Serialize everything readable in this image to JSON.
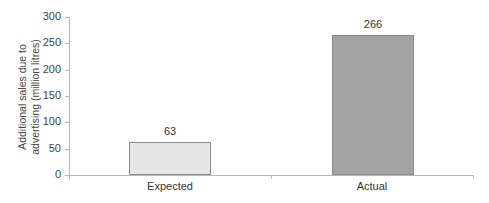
{
  "chart_data": {
    "type": "bar",
    "title": "",
    "xlabel": "",
    "ylabel": "Additional sales due to advertising (million litres)",
    "ylabel_lines": [
      "Additional sales due to",
      "advertising (million litres)"
    ],
    "categories": [
      "Expected",
      "Actual"
    ],
    "values": [
      63,
      266
    ],
    "data_labels": [
      "63",
      "266"
    ],
    "bar_colors": [
      "#e6e6e6",
      "#a3a3a3"
    ],
    "ylim": [
      0,
      300
    ],
    "yticks": [
      0,
      50,
      100,
      150,
      200,
      250,
      300
    ],
    "ytick_labels": [
      "0",
      "50",
      "100",
      "150",
      "200",
      "250",
      "300"
    ],
    "grid": false,
    "legend": null
  }
}
